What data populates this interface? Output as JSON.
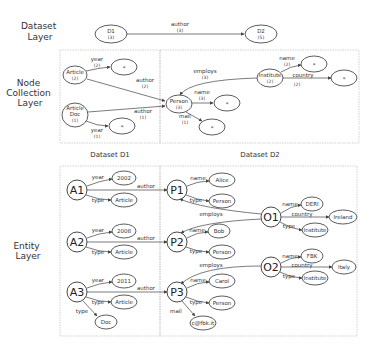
{
  "layers": {
    "dataset": [
      "Dataset",
      "Layer"
    ],
    "node_collection": [
      "Node",
      "Collection",
      "Layer"
    ],
    "entity": [
      "Entity",
      "Layer"
    ]
  },
  "dataset_labels": {
    "d1": "Dataset D1",
    "d2": "Dataset D2"
  },
  "dataset_layer": {
    "d1": {
      "name": "D1",
      "count": "(3)"
    },
    "d2": {
      "name": "D2",
      "count": "(5)"
    },
    "edge": {
      "label": "author",
      "count": "(3)"
    }
  },
  "node_collection_layer": {
    "article": {
      "name": "Article",
      "count": "(2)"
    },
    "article_doc": {
      "line1": "Article",
      "line2": "Doc",
      "count": "(1)"
    },
    "person": {
      "name": "Person",
      "count": "(3)"
    },
    "institute": {
      "name": "Institute",
      "count": "(2)"
    },
    "wildcard": "*",
    "edges": {
      "article_year": {
        "label": "year",
        "count": "(2)"
      },
      "article_author": {
        "label": "author",
        "count": "(2)"
      },
      "articledoc_author": {
        "label": "author",
        "count": "(1)"
      },
      "articledoc_year": {
        "label": "year",
        "count": "(1)"
      },
      "person_name": {
        "label": "name",
        "count": "(3)"
      },
      "person_mail": {
        "label": "mail",
        "count": "(1)"
      },
      "institute_employs": {
        "label": "employs",
        "count": "(3)"
      },
      "institute_name": {
        "label": "name",
        "count": "(2)"
      },
      "institute_country": {
        "label": "country",
        "count": "(2)"
      }
    }
  },
  "entity_layer": {
    "articles": [
      {
        "id": "A1",
        "year": "2002",
        "types": [
          "Article"
        ]
      },
      {
        "id": "A2",
        "year": "2008",
        "types": [
          "Article"
        ]
      },
      {
        "id": "A3",
        "year": "2011",
        "types": [
          "Article",
          "Doc"
        ]
      }
    ],
    "persons": [
      {
        "id": "P1",
        "name": "Alice",
        "type": "Person"
      },
      {
        "id": "P2",
        "name": "Bob",
        "type": "Person"
      },
      {
        "id": "P3",
        "name": "Carol",
        "type": "Person",
        "mail": "c@fbk.it"
      }
    ],
    "orgs": [
      {
        "id": "O1",
        "name": "DERI",
        "country": "Ireland",
        "type": "Institute"
      },
      {
        "id": "O2",
        "name": "FBK",
        "country": "Italy",
        "type": "Institute"
      }
    ],
    "edge_labels": {
      "year": "year",
      "type": "type",
      "author": "author",
      "name": "name",
      "mail": "mail",
      "employs": "employs",
      "country": "country"
    }
  }
}
